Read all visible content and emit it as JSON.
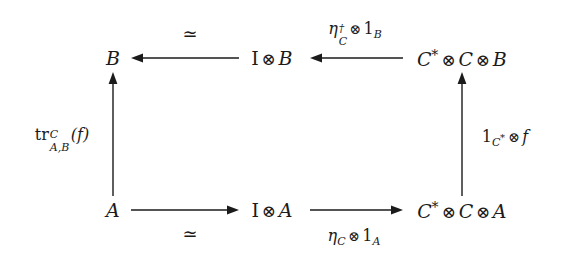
{
  "diagram": {
    "type": "commutative-diagram",
    "background_color": "#ffffff",
    "ink_color": "#1b1b1b",
    "nodes": [
      {
        "id": "B",
        "label": "B",
        "row": "top",
        "col": "left",
        "x": 113,
        "y": 58
      },
      {
        "id": "IB",
        "label": "I ⊗ B",
        "row": "top",
        "col": "middle",
        "x": 272,
        "y": 58
      },
      {
        "id": "CCB",
        "label": "C* ⊗ C ⊗ B",
        "row": "top",
        "col": "right",
        "x": 462,
        "y": 58
      },
      {
        "id": "A",
        "label": "A",
        "row": "bottom",
        "col": "left",
        "x": 113,
        "y": 210
      },
      {
        "id": "IA",
        "label": "I ⊗ A",
        "row": "bottom",
        "col": "middle",
        "x": 272,
        "y": 210
      },
      {
        "id": "CCA",
        "label": "C* ⊗ C ⊗ A",
        "row": "bottom",
        "col": "right",
        "x": 462,
        "y": 210
      }
    ],
    "arrows": [
      {
        "id": "top-left-arrow",
        "from": "IB",
        "to": "B",
        "direction": "left",
        "label": "≃",
        "label_position": "above"
      },
      {
        "id": "top-right-arrow",
        "from": "CCB",
        "to": "IB",
        "direction": "left",
        "label": "η†_C ⊗ 1_B",
        "label_position": "above"
      },
      {
        "id": "left-vertical-arrow",
        "from": "A",
        "to": "B",
        "direction": "up",
        "label": "tr^C_{A,B}(f)",
        "label_position": "left"
      },
      {
        "id": "right-vertical-arrow",
        "from": "CCA",
        "to": "CCB",
        "direction": "up",
        "label": "1_{C*} ⊗ f",
        "label_position": "right"
      },
      {
        "id": "bottom-left-arrow",
        "from": "A",
        "to": "IA",
        "direction": "right",
        "label": "≃",
        "label_position": "below"
      },
      {
        "id": "bottom-right-arrow",
        "from": "IA",
        "to": "CCA",
        "direction": "right",
        "label": "η_C ⊗ 1_A",
        "label_position": "below"
      }
    ],
    "labels": {
      "top_left_simeq": "≃",
      "bottom_left_simeq": "≃",
      "eta_dagger_symbol": "η",
      "dagger_symbol": "†",
      "eta_dagger_sub": "C",
      "one_B": "1",
      "one_B_sub": "B",
      "eta_symbol": "η",
      "eta_sub": "C",
      "one_A": "1",
      "one_A_sub": "A",
      "trace_name": "tr",
      "trace_sup": "C",
      "trace_sub": "A,B",
      "trace_arg": "(f)",
      "one_Cstar": "1",
      "one_Cstar_sub": "C",
      "one_Cstar_star": "*",
      "map_f": "f",
      "otimes": "⊗",
      "star": "*",
      "unit_I": "I",
      "object_A": "A",
      "object_B": "B",
      "object_C": "C"
    }
  }
}
